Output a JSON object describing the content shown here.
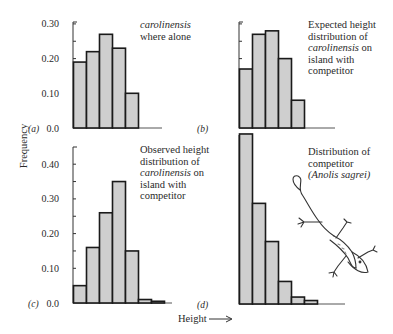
{
  "figure": {
    "ylabel": "Frequency",
    "xlabel": "Height",
    "xlabel_arrow": "→",
    "bar_fill": "#cfcfcf",
    "bar_stroke": "#1a1a1a"
  },
  "chart_data": [
    {
      "type": "bar",
      "panel": "(a)",
      "title": "carolinensis where alone",
      "title_lines": [
        {
          "text": "carolinensis",
          "italic": true
        },
        {
          "text": "where alone",
          "italic": false
        }
      ],
      "categories": [
        "1",
        "2",
        "3",
        "4",
        "5"
      ],
      "values": [
        0.19,
        0.22,
        0.27,
        0.23,
        0.1
      ],
      "xlabel": "Height",
      "ylabel": "Frequency",
      "ylim": [
        0,
        0.3
      ],
      "yticks": [
        "0.0",
        "0.10",
        "0.20",
        "0.30"
      ],
      "grid": false
    },
    {
      "type": "bar",
      "panel": "(b)",
      "title": "Expected height distribution of carolinensis on island with competitor",
      "title_lines": [
        {
          "text": "Expected height",
          "italic": false
        },
        {
          "text": "distribution of",
          "italic": false
        },
        {
          "text": "carolinensis",
          "italic": true,
          "suffix": " on"
        },
        {
          "text": "island with",
          "italic": false
        },
        {
          "text": "competitor",
          "italic": false
        }
      ],
      "categories": [
        "1",
        "2",
        "3",
        "4",
        "5"
      ],
      "values": [
        0.17,
        0.27,
        0.28,
        0.2,
        0.08
      ],
      "xlabel": "Height",
      "ylabel": "Frequency",
      "ylim": [
        0,
        0.3
      ],
      "yticks": [],
      "grid": false
    },
    {
      "type": "bar",
      "panel": "(c)",
      "title": "Observed height distribution of carolinensis on island with competitor",
      "title_lines": [
        {
          "text": "Observed height",
          "italic": false
        },
        {
          "text": "distribution of",
          "italic": false
        },
        {
          "text": "carolinensis",
          "italic": true,
          "suffix": " on"
        },
        {
          "text": "island with",
          "italic": false
        },
        {
          "text": "competitor",
          "italic": false
        }
      ],
      "categories": [
        "1",
        "2",
        "3",
        "4",
        "5",
        "6",
        "7"
      ],
      "values": [
        0.05,
        0.16,
        0.26,
        0.35,
        0.15,
        0.01,
        0.005
      ],
      "xlabel": "Height",
      "ylabel": "Frequency",
      "ylim": [
        0,
        0.4
      ],
      "yticks": [
        "0.0",
        "0.10",
        "0.20",
        "0.30",
        "0.40"
      ],
      "grid": false
    },
    {
      "type": "bar",
      "panel": "(d)",
      "title": "Distribution of competitor (Anolis sagrei)",
      "title_lines": [
        {
          "text": "Distribution of",
          "italic": false
        },
        {
          "text": "competitor",
          "italic": false
        },
        {
          "text": "(Anolis sagrei)",
          "italic": true
        }
      ],
      "categories": [
        "1",
        "2",
        "3",
        "4",
        "5",
        "6"
      ],
      "values": [
        0.49,
        0.29,
        0.18,
        0.065,
        0.02,
        0.01
      ],
      "xlabel": "Height",
      "ylabel": "Frequency",
      "ylim": [
        0,
        0.5
      ],
      "yticks": [],
      "grid": false,
      "illustration": "lizard-icon"
    }
  ]
}
